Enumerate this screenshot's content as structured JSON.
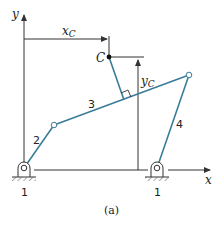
{
  "diagram": {
    "caption": "(a)",
    "axes": {
      "x_label": "x",
      "y_label": "y"
    },
    "dimensions": {
      "xc_label": "x",
      "xc_sub": "C",
      "yc_label": "y",
      "yc_sub": "C"
    },
    "point_label": "C",
    "links": [
      {
        "id": "1",
        "label": "1"
      },
      {
        "id": "2",
        "label": "2"
      },
      {
        "id": "3",
        "label": "3"
      },
      {
        "id": "4",
        "label": "4"
      }
    ],
    "ground_labels": [
      "1",
      "1"
    ],
    "colors": {
      "link": "#3a7d98",
      "axis": "#333333"
    }
  }
}
